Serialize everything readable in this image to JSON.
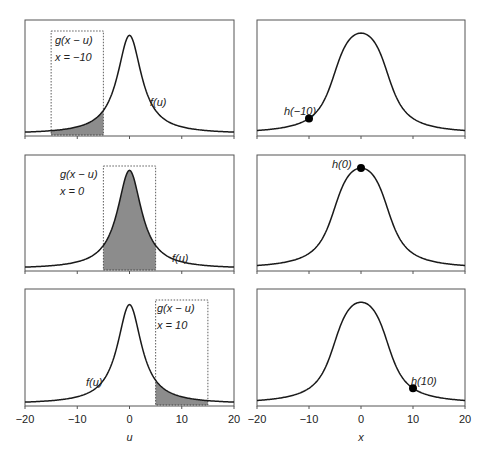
{
  "chart_data": [
    {
      "type": "area",
      "panel": "left-top",
      "description": "f(u) Lorentzian-like peak with rectangular window g(x-u) at x=-10; shaded overlap",
      "x_range": [
        -20,
        20
      ],
      "window": {
        "center": -10,
        "half_width": 5
      },
      "labels": {
        "window": "g(x − u)",
        "x_value": "x = −10",
        "curve": "f(u)"
      }
    },
    {
      "type": "area",
      "panel": "left-middle",
      "x_range": [
        -20,
        20
      ],
      "window": {
        "center": 0,
        "half_width": 5
      },
      "labels": {
        "window": "g(x − u)",
        "x_value": "x = 0",
        "curve": "f(u)"
      }
    },
    {
      "type": "area",
      "panel": "left-bottom",
      "x_range": [
        -20,
        20
      ],
      "window": {
        "center": 10,
        "half_width": 5
      },
      "labels": {
        "window": "g(x − u)",
        "x_value": "x = 10",
        "curve": "f(u)"
      },
      "xlabel": "u",
      "xticks": [
        -20,
        -10,
        0,
        10,
        20
      ]
    },
    {
      "type": "line",
      "panel": "right-top",
      "description": "Convolution h(x) with marked point",
      "x_range": [
        -20,
        20
      ],
      "point": {
        "x": -10,
        "label": "h(−10)"
      }
    },
    {
      "type": "line",
      "panel": "right-middle",
      "x_range": [
        -20,
        20
      ],
      "point": {
        "x": 0,
        "label": "h(0)"
      }
    },
    {
      "type": "line",
      "panel": "right-bottom",
      "x_range": [
        -20,
        20
      ],
      "point": {
        "x": 10,
        "label": "h(10)"
      },
      "xlabel": "x",
      "xticks": [
        -20,
        -10,
        0,
        10,
        20
      ]
    }
  ],
  "axes": {
    "left_xlabel": "u",
    "right_xlabel": "x",
    "ticks": [
      "−20",
      "−10",
      "0",
      "10",
      "20"
    ]
  },
  "labels": {
    "g": "g(x − u)",
    "f": "f(u)",
    "x_m10": "x = −10",
    "x_0": "x = 0",
    "x_10": "x = 10",
    "h_m10": "h(−10)",
    "h_0": "h(0)",
    "h_10": "h(10)"
  },
  "colors": {
    "line": "#1a1a1a",
    "fill": "#8c8c8c",
    "frame": "#555555"
  }
}
